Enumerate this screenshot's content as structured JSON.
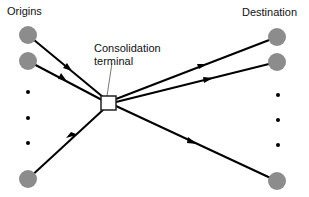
{
  "labels": {
    "origins": "Origins",
    "destination": "Destination",
    "terminal_line1": "Consolidation",
    "terminal_line2": "terminal"
  },
  "colors": {
    "node_fill": "#8c8c8c",
    "edge": "#000000",
    "terminal_fill": "#ffffff",
    "terminal_stroke": "#222222"
  },
  "nodes": {
    "origins": [
      {
        "x": 28,
        "y": 35
      },
      {
        "x": 28,
        "y": 61
      },
      {
        "x": 28,
        "y": 179
      }
    ],
    "origin_ellipsis_dots": [
      {
        "x": 28,
        "y": 92
      },
      {
        "x": 28,
        "y": 118
      },
      {
        "x": 28,
        "y": 143
      }
    ],
    "destinations": [
      {
        "x": 277,
        "y": 37
      },
      {
        "x": 277,
        "y": 62
      },
      {
        "x": 277,
        "y": 181
      }
    ],
    "destination_ellipsis_dots": [
      {
        "x": 278,
        "y": 95
      },
      {
        "x": 278,
        "y": 120
      },
      {
        "x": 278,
        "y": 145
      }
    ],
    "terminal": {
      "x": 101,
      "y": 96,
      "w": 15,
      "h": 14
    }
  }
}
